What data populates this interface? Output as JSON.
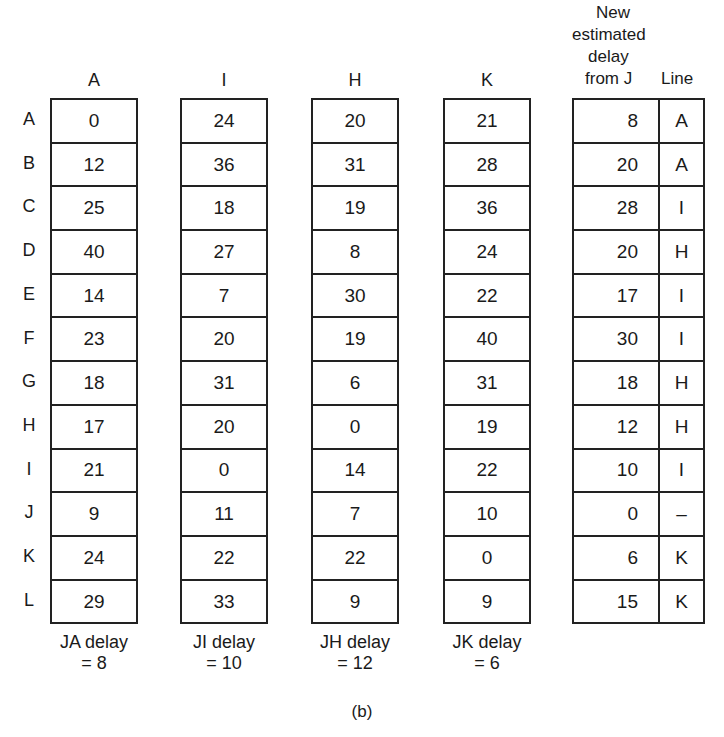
{
  "figure_caption": "(b)",
  "row_labels": [
    "A",
    "B",
    "C",
    "D",
    "E",
    "F",
    "G",
    "H",
    "I",
    "J",
    "K",
    "L"
  ],
  "neighbor_tables": [
    {
      "header": "A",
      "values": [
        "0",
        "12",
        "25",
        "40",
        "14",
        "23",
        "18",
        "17",
        "21",
        "9",
        "24",
        "29"
      ],
      "footnote_line1": "JA delay",
      "footnote_line2": "= 8"
    },
    {
      "header": "I",
      "values": [
        "24",
        "36",
        "18",
        "27",
        "7",
        "20",
        "31",
        "20",
        "0",
        "11",
        "22",
        "33"
      ],
      "footnote_line1": "JI delay",
      "footnote_line2": "= 10"
    },
    {
      "header": "H",
      "values": [
        "20",
        "31",
        "19",
        "8",
        "30",
        "19",
        "6",
        "0",
        "14",
        "7",
        "22",
        "9"
      ],
      "footnote_line1": "JH delay",
      "footnote_line2": "= 12"
    },
    {
      "header": "K",
      "values": [
        "21",
        "28",
        "36",
        "24",
        "22",
        "40",
        "31",
        "19",
        "22",
        "10",
        "0",
        "9"
      ],
      "footnote_line1": "JK delay",
      "footnote_line2": "= 6"
    }
  ],
  "new_table": {
    "header_line1": "New",
    "header_line2": "estimated",
    "header_line3": "delay",
    "header_line4": "from J",
    "line_header": "Line",
    "rows": [
      {
        "delay": "8",
        "line": "A"
      },
      {
        "delay": "20",
        "line": "A"
      },
      {
        "delay": "28",
        "line": "I"
      },
      {
        "delay": "20",
        "line": "H"
      },
      {
        "delay": "17",
        "line": "I"
      },
      {
        "delay": "30",
        "line": "I"
      },
      {
        "delay": "18",
        "line": "H"
      },
      {
        "delay": "12",
        "line": "H"
      },
      {
        "delay": "10",
        "line": "I"
      },
      {
        "delay": "0",
        "line": "–"
      },
      {
        "delay": "6",
        "line": "K"
      },
      {
        "delay": "15",
        "line": "K"
      }
    ]
  }
}
